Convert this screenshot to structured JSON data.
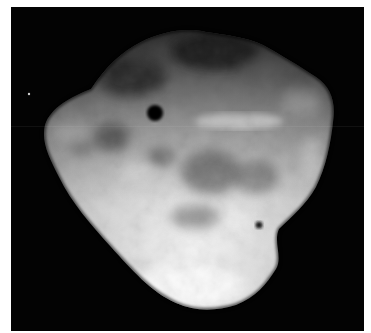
{
  "image": {
    "subject": "asteroid",
    "description": "Grayscale telescope/spacecraft image of an irregularly shaped asteroid on a black background",
    "colors": {
      "background": "#030303",
      "margin": "#ffffff",
      "surface_bright": "#f4f4f4",
      "surface_mid": "#b8b8b8",
      "surface_dark": "#6a6a6a",
      "spot": "#050505"
    },
    "features": [
      {
        "name": "large-dark-spot",
        "cx": 144,
        "cy": 106,
        "r": 8
      },
      {
        "name": "small-dark-spot",
        "cx": 248,
        "cy": 218,
        "r": 3.5
      },
      {
        "name": "bright-streak",
        "x1": 186,
        "x2": 268,
        "y": 114
      },
      {
        "name": "distant-star",
        "cx": 18,
        "cy": 87
      }
    ]
  }
}
